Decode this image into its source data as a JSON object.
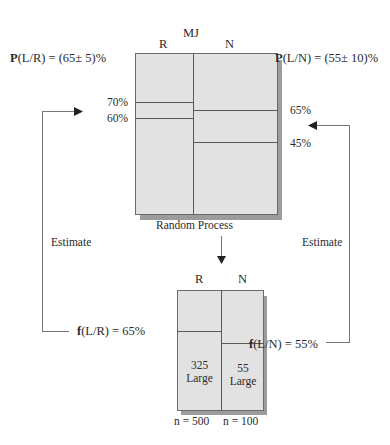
{
  "population": {
    "title": "MJ",
    "columns": [
      "R",
      "N"
    ],
    "caption": "Random Process",
    "r_lines": [
      "70%",
      "60%"
    ],
    "n_lines": [
      "65%",
      "45%"
    ]
  },
  "probabilities": {
    "left": {
      "bold": "P",
      "rest": "(L/R) = (65± 5)%"
    },
    "right": {
      "bold": "P",
      "rest": "(L/N) = (55± 10)%"
    }
  },
  "sample": {
    "columns": [
      "R",
      "N"
    ],
    "r_cell": {
      "count": "325",
      "label": "Large"
    },
    "n_cell": {
      "count": "55",
      "label": "Large"
    },
    "n_labels": [
      "n = 500",
      "n = 100"
    ]
  },
  "frequencies": {
    "left": {
      "bold": "f",
      "rest": "(L/R) = 65%"
    },
    "right": {
      "bold": "f",
      "rest": "(L/N) = 55%"
    }
  },
  "arrows": {
    "left_label": "Estimate",
    "right_label": "Estimate"
  },
  "colors": {
    "box_fill": "#e2e2e2",
    "shadow": "#9c9c9c",
    "line": "#5a5a5a"
  }
}
